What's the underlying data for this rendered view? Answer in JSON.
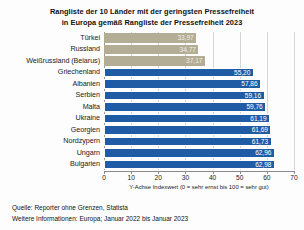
{
  "title": {
    "line1": "Rangliste der 10 Länder mit der geringsten Pressefreiheit",
    "line2": "in Europa gemäß Rangliste der Pressefreiheit 2023"
  },
  "colors": {
    "beige_bar": "#b4ad95",
    "blue_bar": "#1f5ca5",
    "background": "#fdfdfd",
    "gridline": "#d6d6d6"
  },
  "footer": {
    "source": "Quelle: Reporter ohne Grenzen, Statista",
    "info": "Weitere Informationen: Europa; Januar 2022 bis Januar 2023"
  },
  "chart_data": {
    "type": "bar",
    "orientation": "horizontal",
    "title": "Rangliste der 10 Länder mit der geringsten Pressefreiheit in Europa gemäß Rangliste der Pressefreiheit 2023",
    "xlabel": "Y-Achse Indexwert (0 = sehr ernst bis 100 = sehr gut)",
    "ylabel": "",
    "xlim": [
      0,
      70
    ],
    "xticks": [
      0,
      10,
      20,
      30,
      40,
      50,
      60,
      70
    ],
    "xtick_labels": [
      "0",
      "10",
      "20",
      "30",
      "40",
      "50",
      "60",
      "70"
    ],
    "grid": true,
    "legend": false,
    "categories": [
      "Türkei",
      "Russland",
      "Weißrussland (Belarus)",
      "Griechenland",
      "Albanien",
      "Serbien",
      "Malta",
      "Ukraine",
      "Georgien",
      "Nordzypern",
      "Ungarn",
      "Bulgarien"
    ],
    "values": [
      33.97,
      34.77,
      37.17,
      55.2,
      57.86,
      59.16,
      59.76,
      61.19,
      61.69,
      61.73,
      62.96,
      62.98
    ],
    "value_labels": [
      "33,97",
      "34,77",
      "37,17",
      "55,20",
      "57,86",
      "59,16",
      "59,76",
      "61,19",
      "61,69",
      "61,73",
      "62,96",
      "62,98"
    ],
    "bar_colors": [
      "beige",
      "beige",
      "beige",
      "blue",
      "blue",
      "blue",
      "blue",
      "blue",
      "blue",
      "blue",
      "blue",
      "blue"
    ]
  }
}
